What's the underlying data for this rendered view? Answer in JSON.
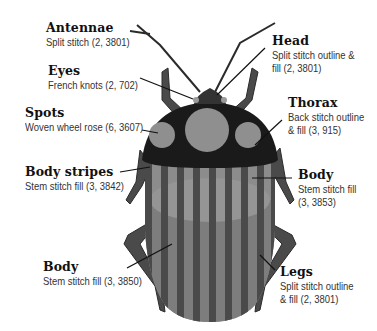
{
  "colors": {
    "outline": "#2b2b2b",
    "stripe_dark": "#4a4a4a",
    "stripe_light": "#8c8c8c",
    "body_lower": "#7d7d7d",
    "spot": "#8f8f8f",
    "thorax": "#1a1a1a",
    "background": "#ffffff"
  },
  "labels": {
    "antennae": {
      "title": "Antennae",
      "desc": [
        "Split stitch (2, 3801)"
      ]
    },
    "eyes": {
      "title": "Eyes",
      "desc": [
        "French knots (2, 702)"
      ]
    },
    "spots": {
      "title": "Spots",
      "desc": [
        "Woven wheel rose (6, 3607)"
      ]
    },
    "body_stripes": {
      "title": "Body stripes",
      "desc": [
        "Stem stitch fill (3, 3842)"
      ]
    },
    "body_lower": {
      "title": "Body",
      "desc": [
        "Stem stitch fill (3, 3850)"
      ]
    },
    "head": {
      "title": "Head",
      "desc": [
        "Split stitch outline &",
        "fill (2, 3801)"
      ]
    },
    "thorax": {
      "title": "Thorax",
      "desc": [
        "Back stitch outline",
        "& fill (3, 915)"
      ]
    },
    "body_upper": {
      "title": "Body",
      "desc": [
        "Stem stitch fill",
        "(3, 3853)"
      ]
    },
    "legs": {
      "title": "Legs",
      "desc": [
        "Split stitch outline",
        "& fill (2, 3801)"
      ]
    }
  }
}
